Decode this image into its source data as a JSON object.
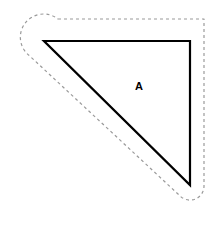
{
  "figure": {
    "width": 224,
    "height": 231,
    "background_color": "#ffffff",
    "shape": {
      "name": "right-triangle",
      "label": "A",
      "label_x": 139,
      "label_y": 87,
      "stroke_color": "#000000",
      "stroke_width": 2.2,
      "fill": "none",
      "vertices": [
        {
          "name": "top-left",
          "x": 44,
          "y": 41
        },
        {
          "name": "top-right",
          "x": 190,
          "y": 41
        },
        {
          "name": "bottom-right",
          "x": 190,
          "y": 185
        }
      ],
      "path": "M 44 41 L 190 41 L 190 185 Z"
    },
    "offset_outline": {
      "name": "dashed-offset-boundary",
      "stroke_color": "#9a9a9a",
      "stroke_width": 1.2,
      "dash_pattern": "3 3",
      "fill": "none",
      "offset_distance": 14,
      "path": "M 58 19 L 204 19 L 204 186 A 14 14 0 0 1 180 195.9 L 29.2 55.5 A 22 22 0 0 1 58 19 Z"
    }
  }
}
